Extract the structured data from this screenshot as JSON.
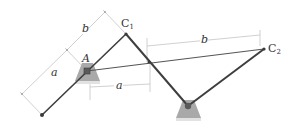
{
  "diagram": {
    "title": "",
    "colors": {
      "link": "#3a3a3a",
      "dim_line": "#bdbdbd",
      "ground_fill": "#a8a8a8",
      "ground_shadow": "#d8d8d8",
      "pin": "#555555",
      "text": "#333333"
    },
    "points": {
      "A": {
        "label": "A",
        "x": 87,
        "y": 71
      },
      "B": {
        "label": "",
        "x": 188,
        "y": 106
      },
      "C1": {
        "label": "C",
        "sub": "1",
        "x": 126,
        "y": 34
      },
      "C2": {
        "label": "C",
        "sub": "2",
        "x": 264,
        "y": 49
      },
      "D": {
        "label": "",
        "x": 42,
        "y": 115
      }
    },
    "links": [
      {
        "name": "crank-D-C1",
        "from": "D",
        "to": "C1"
      },
      {
        "name": "link-C1-B",
        "from": "C1",
        "to": "B"
      },
      {
        "name": "link-B-C2",
        "from": "B",
        "to": "C2"
      },
      {
        "name": "rod-A-C2",
        "from": "A",
        "to": "C2"
      }
    ],
    "dimensions": [
      {
        "name": "dim-b-inclined",
        "label": "b"
      },
      {
        "name": "dim-a-inclined",
        "label": "a"
      },
      {
        "name": "dim-a-horizontal",
        "label": "a"
      },
      {
        "name": "dim-b-horizontal",
        "label": "b"
      }
    ]
  }
}
